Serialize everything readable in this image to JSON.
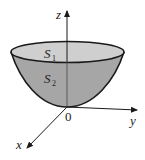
{
  "figure": {
    "type": "paraboloid-region",
    "axes": {
      "z_label": "z",
      "y_label": "y",
      "x_label": "x",
      "origin_label": "0"
    },
    "surfaces": [
      {
        "name": "S",
        "subscript": "1",
        "description": "top disk"
      },
      {
        "name": "S",
        "subscript": "2",
        "description": "paraboloid surface"
      }
    ],
    "colors": {
      "top_disk": "#cfcfcf",
      "bowl": "#a6a6a6",
      "stroke": "#1a1a1a",
      "background": "#ffffff"
    }
  }
}
